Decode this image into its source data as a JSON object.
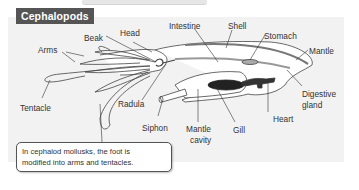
{
  "title": "Cephalopods",
  "labels": {
    "head": "Head",
    "beak": "Beak",
    "arms": "Arms",
    "tentacle": "Tentacle",
    "radula": "Radula",
    "siphon": "Siphon",
    "intestine": "Intestine",
    "shell": "Shell",
    "stomach": "Stomach",
    "mantle": "Mantle",
    "digestive_gland_1": "Digestive",
    "digestive_gland_2": "gland",
    "heart": "Heart",
    "gill": "Gill",
    "mantle_cavity_1": "Mantle",
    "mantle_cavity_2": "cavity"
  },
  "callout": {
    "line1": "In cephalod mollusks, the foot is",
    "line2": "modified into arms and tentacles."
  },
  "colors": {
    "title_bg": "#555555",
    "panel_bg": "#f2f2f2",
    "gill": "#222222",
    "shell": "#888888"
  }
}
